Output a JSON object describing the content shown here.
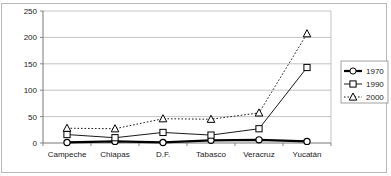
{
  "chart_data": {
    "type": "line",
    "title": "",
    "subtitle": "",
    "xlabel": "",
    "ylabel": "",
    "ylim": [
      0,
      250
    ],
    "yticks": [
      0,
      50,
      100,
      150,
      200,
      250
    ],
    "grid": true,
    "legend_position": "right",
    "categories": [
      "Campeche",
      "Chiapas",
      "D.F.",
      "Tabasco",
      "Veracruz",
      "Yucatán"
    ],
    "series": [
      {
        "name": "1970",
        "values": [
          1,
          3,
          1,
          5,
          6,
          3
        ],
        "marker": "circle",
        "line_style": "solid",
        "line_width": 2.2,
        "color": "#000000"
      },
      {
        "name": "1990",
        "values": [
          16,
          10,
          20,
          15,
          27,
          143
        ],
        "marker": "square",
        "line_style": "solid",
        "line_width": 0.9,
        "color": "#000000"
      },
      {
        "name": "2000",
        "values": [
          28,
          27,
          46,
          45,
          57,
          207
        ],
        "marker": "triangle",
        "line_style": "dotted",
        "line_width": 0.9,
        "color": "#000000"
      }
    ]
  },
  "legend": {
    "entries": [
      {
        "label": "1970"
      },
      {
        "label": "1990"
      },
      {
        "label": "2000"
      }
    ]
  },
  "yaxis": {
    "ticks": [
      "0",
      "50",
      "100",
      "150",
      "200",
      "250"
    ]
  }
}
